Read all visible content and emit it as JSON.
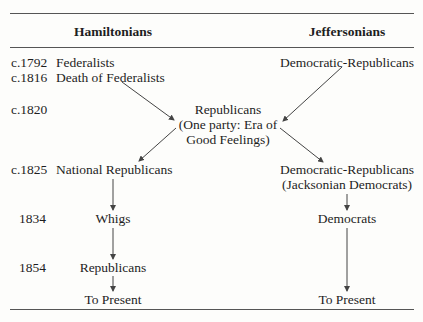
{
  "headers": {
    "left": "Hamiltonians",
    "right": "Jeffersonians"
  },
  "years": {
    "y1792": "c.1792",
    "y1816": "c.1816",
    "y1820": "c.1820",
    "y1825": "c.1825",
    "y1834": "1834",
    "y1854": "1854"
  },
  "hamiltonians": {
    "federalists": "Federalists",
    "death": "Death of Federalists",
    "national_republicans": "National Republicans",
    "whigs": "Whigs",
    "republicans": "Republicans",
    "to_present": "To Present"
  },
  "center": {
    "line1": "Republicans",
    "line2": "(One party: Era of",
    "line3": "Good Feelings)"
  },
  "jeffersonians": {
    "dem_rep": "Democratic-Republicans",
    "dem_rep_1825": "Democratic-Republicans",
    "jacksonian": "(Jacksonian Democrats)",
    "democrats": "Democrats",
    "to_present": "To Present"
  },
  "colors": {
    "text": "#1e1e1e",
    "rule": "#555555",
    "arrow": "#444444"
  }
}
